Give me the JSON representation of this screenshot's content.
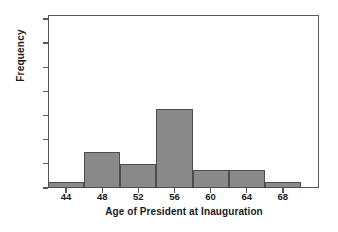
{
  "chart_data": {
    "type": "bar",
    "title": "",
    "xlabel": "Age of President at Inauguration",
    "ylabel": "Frequency",
    "grid": false,
    "legend": null,
    "bin_width": 4,
    "bin_edges": [
      42,
      46,
      50,
      54,
      58,
      62,
      66,
      70
    ],
    "categories": [
      "42-46",
      "46-50",
      "50-54",
      "54-58",
      "58-62",
      "62-66",
      "66-70"
    ],
    "x": [
      44,
      48,
      52,
      56,
      60,
      64,
      68
    ],
    "values": [
      2,
      7,
      5,
      14,
      4,
      4,
      2
    ],
    "xlim": [
      42,
      72
    ],
    "ylim": [
      0,
      30
    ],
    "xticks": [
      44,
      48,
      52,
      56,
      60,
      64,
      68
    ],
    "xtick_labels": [
      "44",
      "48",
      "52",
      "56",
      "60",
      "64",
      "68"
    ],
    "yticks": [
      1,
      5,
      9,
      13,
      17,
      21,
      25,
      29
    ],
    "ytick_labels": [
      "1",
      "5",
      "9",
      "13",
      "17",
      "21",
      "25",
      "29"
    ],
    "colors": {
      "bar_fill": "#8a8a8a",
      "bar_edge": "#4a4e50",
      "axis": "#55595c",
      "text": "#1a1a1a",
      "background": "#ffffff"
    }
  }
}
